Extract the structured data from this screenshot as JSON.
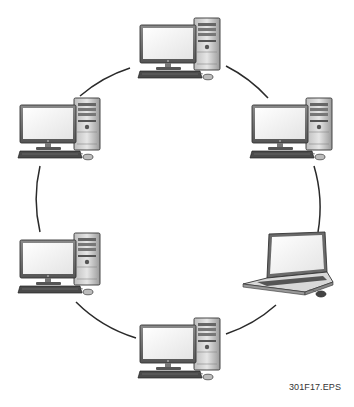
{
  "diagram": {
    "type": "ring-network-topology",
    "figure_label": "301F17.EPS",
    "ring": {
      "cx": 177,
      "cy": 210,
      "r": 145,
      "stroke": "#2a2a2a"
    },
    "nodes": [
      {
        "id": "top",
        "kind": "desktop",
        "x": 140,
        "y": 18
      },
      {
        "id": "upper-right",
        "kind": "desktop",
        "x": 252,
        "y": 98
      },
      {
        "id": "lower-right",
        "kind": "laptop",
        "x": 243,
        "y": 232
      },
      {
        "id": "bottom",
        "kind": "desktop",
        "x": 140,
        "y": 318
      },
      {
        "id": "lower-left",
        "kind": "desktop",
        "x": 20,
        "y": 233
      },
      {
        "id": "upper-left",
        "kind": "desktop",
        "x": 20,
        "y": 98
      }
    ],
    "links": [
      [
        "top",
        "upper-right"
      ],
      [
        "upper-right",
        "lower-right"
      ],
      [
        "lower-right",
        "bottom"
      ],
      [
        "bottom",
        "lower-left"
      ],
      [
        "lower-left",
        "upper-left"
      ],
      [
        "upper-left",
        "top"
      ]
    ]
  }
}
